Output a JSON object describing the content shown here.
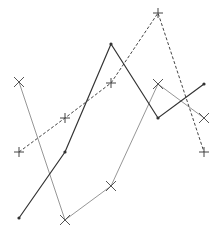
{
  "chart_data": {
    "type": "line",
    "title": "",
    "xlabel": "",
    "ylabel": "",
    "x": [
      1,
      2,
      3,
      4,
      5
    ],
    "ylim": [
      0,
      234
    ],
    "grid": false,
    "axes_visible": false,
    "legend": null,
    "series": [
      {
        "name": "series-solid",
        "style": "solid",
        "marker": "dot",
        "color": "#333333",
        "values": [
          16,
          82,
          190,
          116,
          150
        ]
      },
      {
        "name": "series-dashed",
        "style": "dashed",
        "marker": "plus",
        "color": "#444444",
        "values": [
          82,
          116,
          151,
          221,
          82
        ]
      },
      {
        "name": "series-light",
        "style": "solid-thin",
        "marker": "x",
        "color": "#8a8a8a",
        "values": [
          152,
          14,
          48,
          150,
          116
        ]
      }
    ]
  },
  "layout": {
    "width": 221,
    "height": 234,
    "x_pixels": [
      19,
      65,
      111,
      158,
      204
    ]
  }
}
